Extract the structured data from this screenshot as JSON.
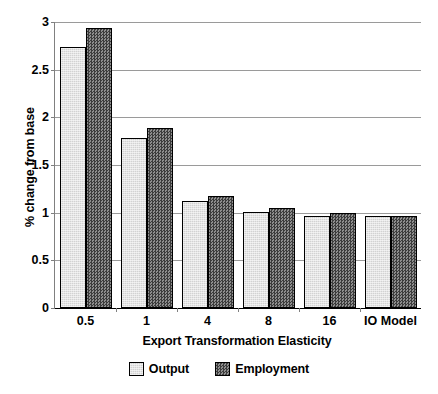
{
  "chart_data": {
    "type": "bar",
    "title": "",
    "xlabel": "Export Transformation Elasticity",
    "ylabel": "% change from base",
    "categories": [
      "0.5",
      "1",
      "4",
      "8",
      "16",
      "IO Model"
    ],
    "series": [
      {
        "name": "Output",
        "color": "#d2d2d2",
        "values": [
          2.74,
          1.78,
          1.12,
          1.01,
          0.97,
          0.96
        ]
      },
      {
        "name": "Employment",
        "color": "#565656",
        "values": [
          2.94,
          1.89,
          1.17,
          1.05,
          1.0,
          0.96
        ]
      }
    ],
    "ylim": [
      0,
      3
    ],
    "yticks": [
      0,
      0.5,
      1,
      1.5,
      2,
      2.5,
      3
    ],
    "ytick_labels": [
      "0",
      "0.5",
      "1",
      "1.5",
      "2",
      "2.5",
      "3"
    ],
    "grid": true,
    "legend_position": "bottom"
  }
}
